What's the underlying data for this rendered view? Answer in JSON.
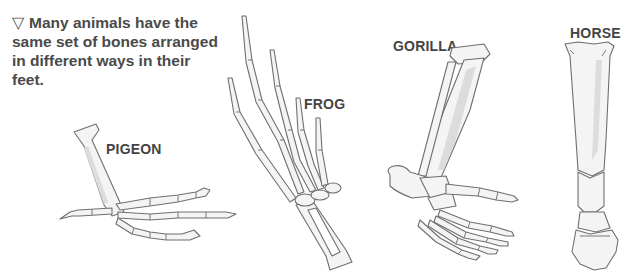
{
  "caption": {
    "marker": "▽",
    "text": "Many animals have the same set of bones arranged in different ways in their feet."
  },
  "figures": [
    {
      "id": "pigeon",
      "label": "PIGEON"
    },
    {
      "id": "frog",
      "label": "FROG"
    },
    {
      "id": "gorilla",
      "label": "GORILLA"
    },
    {
      "id": "horse",
      "label": "HORSE"
    }
  ],
  "colors": {
    "text": "#4a4a4a",
    "bone_fill": "#f4f4f4",
    "bone_outline": "#6f6f6f",
    "background": "#ffffff"
  }
}
